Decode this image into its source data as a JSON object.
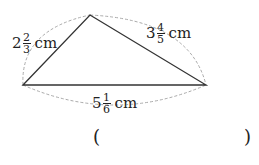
{
  "diagram": {
    "type": "triangle",
    "vertices": {
      "left": [
        23,
        85
      ],
      "top": [
        90,
        15
      ],
      "right": [
        206,
        85
      ]
    },
    "sides": {
      "left": {
        "whole": "2",
        "num": "2",
        "den": "3",
        "unit": "cm"
      },
      "right": {
        "whole": "3",
        "num": "4",
        "den": "5",
        "unit": "cm"
      },
      "bottom": {
        "whole": "5",
        "num": "1",
        "den": "6",
        "unit": "cm"
      }
    },
    "colors": {
      "edge": "#333333",
      "arc": "#aaaaaa"
    }
  },
  "answer": {
    "open": "(",
    "close": ")"
  }
}
